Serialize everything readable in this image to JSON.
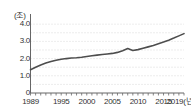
{
  "chart_data": {
    "type": "line",
    "title": "",
    "subtitle": "",
    "xlabel": "(년)",
    "ylabel": "(조)",
    "unit_label": "(조)",
    "x_unit_label": "(년)",
    "xlim": [
      1989,
      2019
    ],
    "ylim": [
      0,
      4.3
    ],
    "yticks": [
      0,
      1.0,
      2.0,
      3.0,
      4.0
    ],
    "ytick_labels": [
      "0",
      "1.0",
      "2.0",
      "3.0",
      "4.0"
    ],
    "xticks": [
      1989,
      1995,
      2000,
      2005,
      2010,
      2015,
      2019
    ],
    "xtick_labels": [
      "1989",
      "1995",
      "2000",
      "2005",
      "2010",
      "2015",
      "2019"
    ],
    "grid": "horizontal-dotted",
    "gridline_interval": 0.5,
    "legend": "none",
    "line_color": "#4d4d4d",
    "grid_color": "#d9d9d9",
    "axis_color": "#666666",
    "series": [
      {
        "name": "value",
        "x": [
          1989,
          1990,
          1991,
          1992,
          1993,
          1994,
          1995,
          1996,
          1997,
          1998,
          1999,
          2000,
          2001,
          2002,
          2003,
          2004,
          2005,
          2006,
          2007,
          2008,
          2009,
          2010,
          2011,
          2012,
          2013,
          2014,
          2015,
          2016,
          2017,
          2018,
          2019
        ],
        "values": [
          1.35,
          1.5,
          1.63,
          1.74,
          1.83,
          1.9,
          1.96,
          2.0,
          2.03,
          2.05,
          2.08,
          2.12,
          2.16,
          2.2,
          2.24,
          2.27,
          2.3,
          2.36,
          2.46,
          2.58,
          2.47,
          2.52,
          2.6,
          2.68,
          2.76,
          2.86,
          2.96,
          3.07,
          3.19,
          3.32,
          3.45
        ]
      }
    ]
  }
}
